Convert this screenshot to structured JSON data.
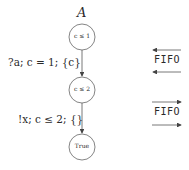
{
  "automaton": {
    "name": "A",
    "states": [
      {
        "label": "c ≤ 1"
      },
      {
        "label": "c ≤ 2"
      },
      {
        "label": "True"
      }
    ],
    "transitions": [
      {
        "label": "?a; c = 1; {c}"
      },
      {
        "label": "!x; c ≤ 2; {}"
      }
    ]
  },
  "channels": [
    {
      "label": "FIFO",
      "direction": "left"
    },
    {
      "label": "FIFO",
      "direction": "right"
    }
  ],
  "colors": {
    "stroke": "#555555",
    "text": "#2a2a2a"
  }
}
